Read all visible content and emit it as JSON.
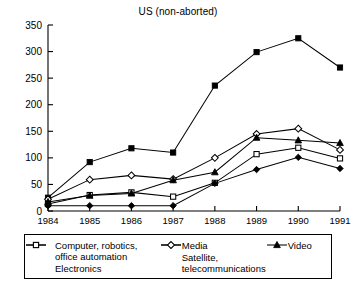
{
  "chart_data": {
    "type": "line",
    "title": "US (non-aborted)",
    "xlabel": "",
    "ylabel": "",
    "categories": [
      "1984",
      "1985",
      "1986",
      "1987",
      "1988",
      "1989",
      "1990",
      "1991"
    ],
    "ylim": [
      0,
      350
    ],
    "yticks": [
      0,
      50,
      100,
      150,
      200,
      250,
      300,
      350
    ],
    "grid": false,
    "legend_position": "below",
    "series": [
      {
        "name": "Computer, robotics,\noffice automation",
        "marker": "filled-square",
        "values": [
          25,
          92,
          118,
          110,
          236,
          299,
          325,
          270
        ]
      },
      {
        "name": "Electronics",
        "marker": "open-square",
        "values": [
          13,
          30,
          35,
          27,
          53,
          107,
          119,
          99
        ]
      },
      {
        "name": "Media",
        "marker": "filled-diamond",
        "values": [
          10,
          10,
          10,
          10,
          52,
          78,
          101,
          80
        ]
      },
      {
        "name": "Satellite,\ntelecommunications",
        "marker": "open-diamond",
        "values": [
          22,
          59,
          67,
          60,
          100,
          145,
          155,
          115
        ]
      },
      {
        "name": "Video",
        "marker": "filled-triangle",
        "values": [
          17,
          29,
          33,
          58,
          73,
          138,
          133,
          128
        ]
      }
    ]
  },
  "legend": {
    "entries": [
      {
        "label": "Computer, robotics,\noffice automation",
        "marker": "filled-square"
      },
      {
        "label": "Electronics",
        "marker": "open-square"
      },
      {
        "label": "Media",
        "marker": "filled-diamond"
      },
      {
        "label": "Satellite,\ntelecommunications",
        "marker": "open-diamond"
      },
      {
        "label": "Video",
        "marker": "filled-triangle"
      }
    ]
  }
}
